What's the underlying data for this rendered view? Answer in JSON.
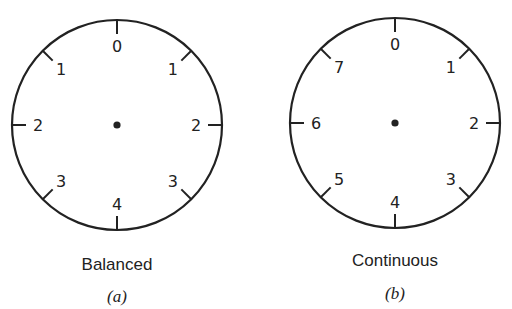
{
  "figures": [
    {
      "id": "a",
      "caption": "Balanced",
      "sublabel": "(a)",
      "center": [
        117,
        125
      ],
      "radius": 105,
      "ticks": [
        {
          "angle": 0,
          "label": "0"
        },
        {
          "angle": 45,
          "label": "1"
        },
        {
          "angle": 90,
          "label": "2"
        },
        {
          "angle": 135,
          "label": "3"
        },
        {
          "angle": 180,
          "label": "4"
        },
        {
          "angle": 225,
          "label": "3"
        },
        {
          "angle": 270,
          "label": "2"
        },
        {
          "angle": 315,
          "label": "1"
        }
      ]
    },
    {
      "id": "b",
      "caption": "Continuous",
      "sublabel": "(b)",
      "center": [
        395,
        123
      ],
      "radius": 105,
      "ticks": [
        {
          "angle": 0,
          "label": "0"
        },
        {
          "angle": 45,
          "label": "1"
        },
        {
          "angle": 90,
          "label": "2"
        },
        {
          "angle": 135,
          "label": "3"
        },
        {
          "angle": 180,
          "label": "4"
        },
        {
          "angle": 225,
          "label": "5"
        },
        {
          "angle": 270,
          "label": "6"
        },
        {
          "angle": 315,
          "label": "7"
        }
      ]
    }
  ],
  "colors": {
    "stroke": "#222222",
    "background": "#ffffff"
  }
}
